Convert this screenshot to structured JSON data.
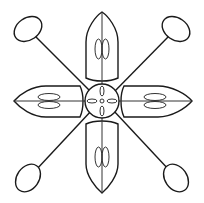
{
  "image": {
    "kind": "line-art-illustration",
    "width": 204,
    "height": 203,
    "background": "#ffffff",
    "stroke_color": "#1a1a1a"
  },
  "figure": {
    "center_circle": {
      "cx": 102,
      "cy": 101,
      "r": 17,
      "inner_marks": [
        "top-oval",
        "bottom-oval",
        "left-oval",
        "right-oval",
        "center-dot"
      ]
    },
    "petals": [
      {
        "id": "top",
        "direction": "up"
      },
      {
        "id": "right",
        "direction": "right"
      },
      {
        "id": "bottom",
        "direction": "down"
      },
      {
        "id": "left",
        "direction": "left"
      }
    ],
    "rods": [
      {
        "id": "top-left",
        "end_ellipse": {
          "cx": 28,
          "cy": 29
        }
      },
      {
        "id": "top-right",
        "end_ellipse": {
          "cx": 176,
          "cy": 29
        }
      },
      {
        "id": "bottom-left",
        "end_ellipse": {
          "cx": 28,
          "cy": 178
        }
      },
      {
        "id": "bottom-right",
        "end_ellipse": {
          "cx": 176,
          "cy": 178
        }
      }
    ]
  }
}
